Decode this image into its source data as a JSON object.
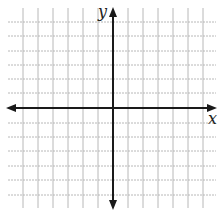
{
  "diagram": {
    "type": "coordinate-plane",
    "x_axis_label": "x",
    "y_axis_label": "y",
    "grid": {
      "vertical_lines_x": [
        23,
        38,
        53,
        68,
        83,
        98,
        128,
        143,
        158,
        173,
        188,
        203
      ],
      "horizontal_lines_y": [
        22,
        36,
        51,
        65,
        79,
        93,
        123,
        137,
        151,
        166,
        180,
        195
      ],
      "grid_color": "#b8b8b8",
      "axis_color": "#1a1a1a"
    },
    "origin": {
      "x": 113,
      "y": 108
    },
    "x_axis_arrows": "both",
    "y_axis_arrows": "both"
  }
}
